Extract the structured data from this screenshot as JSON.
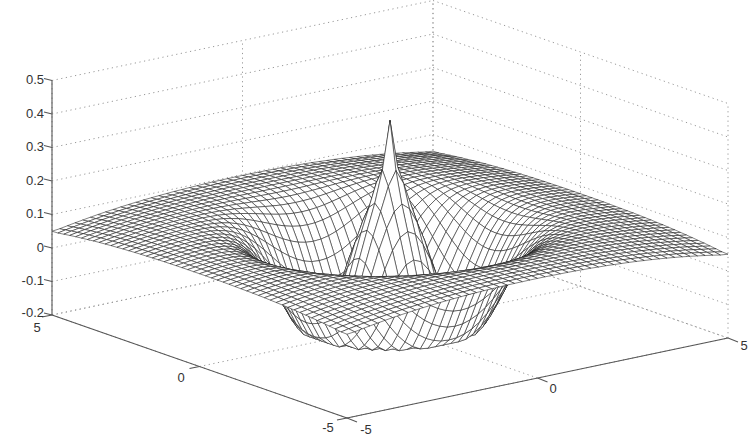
{
  "chart_data": {
    "type": "surface",
    "title": "",
    "xlabel": "",
    "ylabel": "",
    "zlabel": "",
    "x_range": [
      -5,
      5
    ],
    "y_range": [
      -5,
      5
    ],
    "zlim": [
      -0.2,
      0.5
    ],
    "x_ticks": [
      "-5",
      "0",
      "5"
    ],
    "y_ticks": [
      "5",
      "0",
      "-5"
    ],
    "z_ticks": [
      "-0.2",
      "-0.1",
      "0",
      "0.1",
      "0.2",
      "0.3",
      "0.4",
      "0.5"
    ],
    "grid": true,
    "mesh_resolution": 50,
    "features": {
      "peak": {
        "x": 0,
        "y": 0,
        "z": 0.45
      },
      "trough_min_z": -0.15,
      "rim_z": 0.1,
      "corner_z": 0.0
    },
    "colors": {
      "mesh_line": "#1a1a1a",
      "mesh_face": "#ffffff",
      "grid": "#999999",
      "axis": "#555555"
    }
  }
}
